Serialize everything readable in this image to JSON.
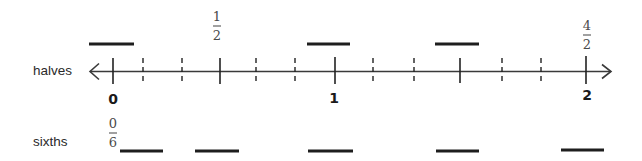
{
  "diagram": {
    "type": "number-line",
    "width": 642,
    "height": 161,
    "colors": {
      "line": "#3a3a3a",
      "bar": "#1e1e1e",
      "text": "#2a2a2a",
      "fraction_text": "#4a4a4a",
      "background": "#ffffff"
    },
    "rows": {
      "halves": {
        "label": "halves",
        "x": 33,
        "y": 75
      },
      "sixths": {
        "label": "sixths",
        "x": 33,
        "y": 146
      }
    },
    "axis": {
      "y": 71.5,
      "x_start": 90,
      "x_end": 611,
      "left_arrow": true,
      "right_arrow": true
    },
    "solid_ticks": [
      {
        "x": 113,
        "y1": 58,
        "y2": 84,
        "value": "0"
      },
      {
        "x": 220,
        "y1": 58,
        "y2": 84,
        "value": "1/2"
      },
      {
        "x": 335,
        "y1": 57,
        "y2": 84,
        "value": "1"
      },
      {
        "x": 460,
        "y1": 58,
        "y2": 83,
        "value": "3/2"
      },
      {
        "x": 586,
        "y1": 56,
        "y2": 84,
        "value": "2"
      }
    ],
    "dashed_ticks": [
      {
        "x": 143
      },
      {
        "x": 182
      },
      {
        "x": 256
      },
      {
        "x": 295
      },
      {
        "x": 373
      },
      {
        "x": 414
      },
      {
        "x": 502
      },
      {
        "x": 541
      }
    ],
    "integer_labels": [
      {
        "text": "0",
        "x": 113,
        "y": 104
      },
      {
        "text": "1",
        "x": 334,
        "y": 103
      },
      {
        "text": "2",
        "x": 587,
        "y": 100
      }
    ],
    "fraction_labels": [
      {
        "numerator": "1",
        "denominator": "2",
        "x": 217,
        "num_y": 21,
        "bar_y": 26,
        "den_y": 40
      },
      {
        "numerator": "4",
        "denominator": "2",
        "x": 587,
        "num_y": 30,
        "bar_y": 35,
        "den_y": 49
      },
      {
        "numerator": "0",
        "denominator": "6",
        "x": 113,
        "num_y": 128,
        "bar_y": 133,
        "den_y": 147
      }
    ],
    "halves_bars": [
      {
        "x1": 89,
        "x2": 134,
        "y": 44
      },
      {
        "x1": 307,
        "x2": 350,
        "y": 44
      },
      {
        "x1": 435,
        "x2": 479,
        "y": 44
      }
    ],
    "sixths_bars": [
      {
        "x1": 120,
        "x2": 163,
        "y": 151
      },
      {
        "x1": 195,
        "x2": 239,
        "y": 151
      },
      {
        "x1": 308,
        "x2": 353,
        "y": 151
      },
      {
        "x1": 436,
        "x2": 479,
        "y": 151
      },
      {
        "x1": 561,
        "x2": 604,
        "y": 150
      }
    ]
  }
}
